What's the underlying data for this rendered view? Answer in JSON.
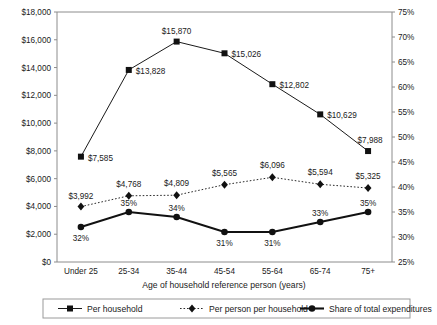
{
  "chart_data": {
    "type": "line",
    "title": "",
    "xlabel": "Age of household reference person (years)",
    "ylabel": "",
    "categories": [
      "Under 25",
      "25-34",
      "35-44",
      "45-54",
      "55-64",
      "65-74",
      "75+"
    ],
    "grid": false,
    "legend_position": "bottom",
    "axes": {
      "left": {
        "min": 0,
        "max": 18000,
        "step": 2000,
        "ticks": [
          "$0",
          "$2,000",
          "$4,000",
          "$6,000",
          "$8,000",
          "$10,000",
          "$12,000",
          "$14,000",
          "$16,000",
          "$18,000"
        ]
      },
      "right": {
        "min": 25,
        "max": 75,
        "step": 5,
        "ticks": [
          "25%",
          "30%",
          "35%",
          "40%",
          "45%",
          "50%",
          "55%",
          "60%",
          "65%",
          "70%",
          "75%"
        ]
      }
    },
    "series": [
      {
        "name": "Per household",
        "axis": "left",
        "marker": "square",
        "line": "solid-thin",
        "values": [
          7585,
          13828,
          15870,
          15026,
          12802,
          10629,
          7988
        ],
        "labels": [
          "$7,585",
          "$13,828",
          "$15,870",
          "$15,026",
          "$12,802",
          "$10,629",
          "$7,988"
        ]
      },
      {
        "name": "Per person per household",
        "axis": "left",
        "marker": "diamond",
        "line": "dotted",
        "values": [
          3992,
          4768,
          4809,
          5565,
          6096,
          5594,
          5325
        ],
        "labels": [
          "$3,992",
          "$4,768",
          "$4,809",
          "$5,565",
          "$6,096",
          "$5,594",
          "$5,325"
        ]
      },
      {
        "name": "Share of total expenditures",
        "axis": "right",
        "marker": "circle",
        "line": "solid-thick",
        "values": [
          32,
          35,
          34,
          31,
          31,
          33,
          35
        ],
        "labels": [
          "32%",
          "35%",
          "34%",
          "31%",
          "31%",
          "33%",
          "35%"
        ]
      }
    ]
  },
  "legend": {
    "items": [
      {
        "label": "Per household"
      },
      {
        "label": "Per person per household"
      },
      {
        "label": "Share of total expenditures"
      }
    ]
  },
  "colors": {
    "line": "#111111",
    "axis": "#8c8c8c",
    "text": "#1a1a1a",
    "background": "#ffffff"
  }
}
